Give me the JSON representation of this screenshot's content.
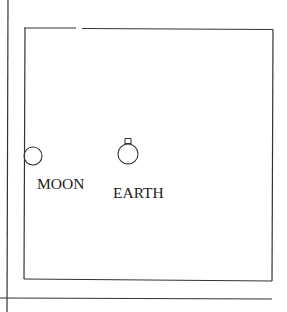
{
  "diagram": {
    "type": "schematic",
    "colors": {
      "stroke": "#333333",
      "text": "#222222",
      "background": "#ffffff"
    },
    "labels": {
      "moon": "MOON",
      "earth": "EARTH"
    },
    "objects": [
      {
        "name": "moon",
        "shape": "circle",
        "cx": 33,
        "cy": 156,
        "r": 9
      },
      {
        "name": "earth",
        "shape": "circle",
        "cx": 128,
        "cy": 154,
        "r": 10,
        "marker": "small-rectangle-on-top"
      }
    ],
    "frame": {
      "left": 24,
      "top": 28,
      "right": 273,
      "bottom": 280,
      "top_gap": [
        76,
        82
      ]
    },
    "axes": {
      "vertical_x": 8,
      "horizontal_y": 298
    }
  }
}
